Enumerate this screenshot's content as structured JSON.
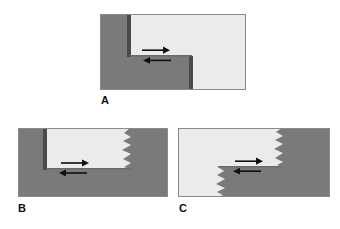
{
  "figure": {
    "background_color": "#ffffff",
    "width": 340,
    "height": 229
  },
  "colors": {
    "block_dark": "#7a7a7a",
    "block_light": "#ebebeb",
    "fault_trace": "#4a4a4a",
    "outline": "#8a8a8a",
    "arrow": "#101010",
    "label_text": "#111111"
  },
  "panels": [
    {
      "id": "A",
      "label": "A",
      "name": "panel-a-releasing-stepover",
      "description": "Rectangular block diagram with a straight-walled right-stepping releasing stepover between two strike-slip fault segments",
      "x": 100,
      "y": 14,
      "width": 146,
      "height": 76,
      "edge_style": "straight",
      "light_region": "upper-right step",
      "fault_segments": 2,
      "arrows": [
        {
          "name": "upper-arrow",
          "direction": "right",
          "sense": "dextral"
        },
        {
          "name": "lower-arrow",
          "direction": "left",
          "sense": "dextral"
        }
      ]
    },
    {
      "id": "B",
      "label": "B",
      "name": "panel-b-pull-apart-basin",
      "description": "Rectangular pull-apart basin bounded on the right by a jagged, serrated fault termination",
      "x": 18,
      "y": 128,
      "width": 150,
      "height": 69,
      "edge_style": "jagged-right",
      "light_region": "rectangular pull-apart basin",
      "teeth_count": 4,
      "arrows": [
        {
          "name": "upper-arrow",
          "direction": "right",
          "sense": "dextral"
        },
        {
          "name": "lower-arrow",
          "direction": "left",
          "sense": "dextral"
        }
      ]
    },
    {
      "id": "C",
      "label": "C",
      "name": "panel-c-jagged-stepover",
      "description": "Z-shaped stepover with serrated jagged fault tips at the upper-right and lower-left terminations",
      "x": 178,
      "y": 128,
      "width": 152,
      "height": 69,
      "edge_style": "jagged-both",
      "light_region": "upper-left and lower-left block",
      "teeth_count_upper": 4,
      "teeth_count_lower": 4,
      "arrows": [
        {
          "name": "upper-arrow",
          "direction": "right",
          "sense": "dextral"
        },
        {
          "name": "lower-arrow",
          "direction": "left",
          "sense": "dextral"
        }
      ]
    }
  ]
}
